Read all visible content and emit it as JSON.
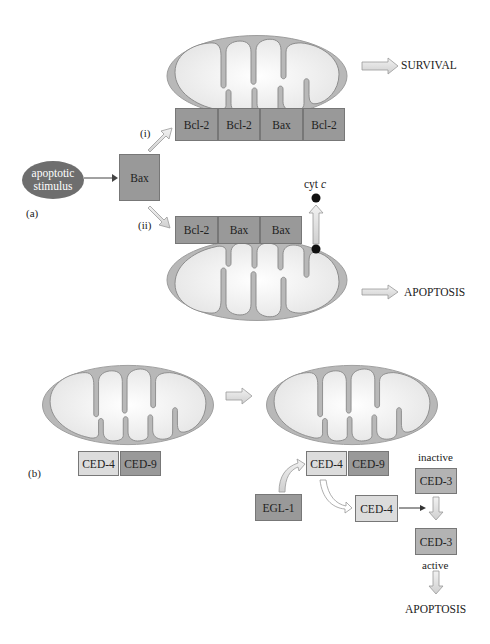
{
  "panel_a": {
    "label": "(a)",
    "stimulus": "apoptotic stimulus",
    "stimulus_line1": "apoptotic",
    "stimulus_line2": "stimulus",
    "bax": "Bax",
    "path_i": "(i)",
    "path_ii": "(ii)",
    "top_proteins": [
      "Bcl-2",
      "Bcl-2",
      "Bax",
      "Bcl-2"
    ],
    "bottom_proteins": [
      "Bcl-2",
      "Bax",
      "Bax"
    ],
    "cyt_c": "cyt",
    "cyt_c_italic": "c",
    "outcome_top": "SURVIVAL",
    "outcome_bottom": "APOPTOSIS"
  },
  "panel_b": {
    "label": "(b)",
    "left_proteins": [
      "CED-4",
      "CED-9"
    ],
    "right_proteins": [
      "CED-4",
      "CED-9"
    ],
    "egl1": "EGL-1",
    "released_ced4": "CED-4",
    "inactive_label": "inactive",
    "ced3_inactive": "CED-3",
    "ced3_active": "CED-3",
    "active_label": "active",
    "outcome": "APOPTOSIS"
  },
  "colors": {
    "membrane": "#b5b5b5",
    "matrix": "#efefef",
    "dark_protein": "#999999",
    "light_protein": "#dcdcdc",
    "stimulus": "#6e6e6e",
    "arrow_fill": "#e2e2e2"
  }
}
